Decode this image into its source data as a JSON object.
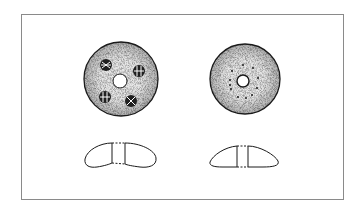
{
  "figure": {
    "frame": {
      "x": 21,
      "y": 14,
      "width": 322,
      "height": 185,
      "stroke": "#8a8a8a"
    },
    "colors": {
      "ink": "#1a1a1a",
      "stipple": "#555555",
      "background": "#ffffff"
    },
    "items": [
      {
        "id": "left-disc",
        "view": "top",
        "cx": 121,
        "cy": 79,
        "r": 37,
        "center_hole_r": 7,
        "markings": [
          {
            "type": "cross-circle",
            "cx": 106,
            "cy": 65,
            "r": 6
          },
          {
            "type": "cross-circle",
            "cx": 139,
            "cy": 71,
            "r": 6
          },
          {
            "type": "cross-circle",
            "cx": 105,
            "cy": 97,
            "r": 6
          },
          {
            "type": "cross-circle",
            "cx": 131,
            "cy": 101,
            "r": 6
          }
        ]
      },
      {
        "id": "right-disc",
        "view": "top",
        "cx": 245,
        "cy": 79,
        "r": 35,
        "center_hole_r": 6,
        "dot_ring": {
          "count": 12,
          "r": 16
        }
      },
      {
        "id": "left-profile",
        "view": "cross-section",
        "cx": 121,
        "cy": 155
      },
      {
        "id": "right-profile",
        "view": "cross-section",
        "cx": 245,
        "cy": 155
      }
    ]
  }
}
